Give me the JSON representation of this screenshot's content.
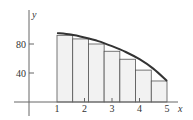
{
  "chart_data": {
    "type": "area",
    "title": "",
    "xlabel": "x",
    "ylabel": "y",
    "xlim": [
      0,
      5.3
    ],
    "ylim": [
      0,
      110
    ],
    "x_ticks": [
      "1",
      "2",
      "3",
      "4",
      "5"
    ],
    "y_ticks": [
      "40",
      "80"
    ],
    "grid": false,
    "curve": {
      "name": "f(x) decreasing curve",
      "x": [
        1,
        1.5,
        2,
        2.5,
        3,
        3.5,
        4,
        4.5,
        5
      ],
      "y": [
        95,
        93,
        89,
        84,
        77,
        69,
        59,
        46,
        29
      ]
    },
    "rectangles": {
      "name": "inscribed rectangles (right endpoints)",
      "count": 7,
      "x_left": [
        1,
        1.571,
        2.143,
        2.714,
        3.286,
        3.857,
        4.429
      ],
      "width": 0.571,
      "heights": [
        92,
        87,
        80,
        70,
        59,
        44,
        29
      ]
    },
    "colors": {
      "curve": "#333333",
      "rect_fill": "#f2f2f2",
      "rect_stroke": "#555555",
      "axis": "#666666"
    }
  }
}
